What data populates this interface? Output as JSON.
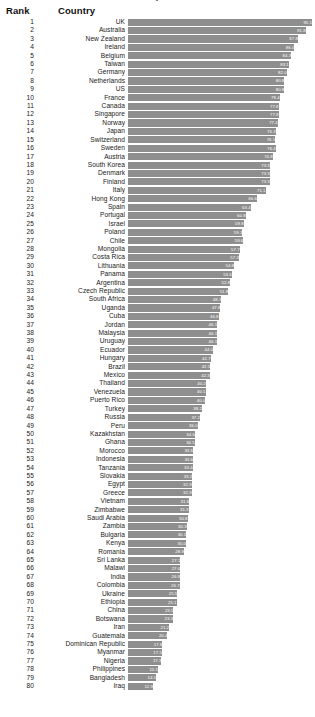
{
  "header": {
    "rank_label": "Rank",
    "country_label": "Country",
    "title_remnant": "y"
  },
  "chart_data": {
    "type": "bar",
    "title": "",
    "xlabel": "",
    "ylabel": "",
    "xlim": [
      0,
      95.1
    ],
    "grid": false,
    "legend": null,
    "orientation": "horizontal",
    "bar_color": "#8e8e8e",
    "value_label_color": "#ffffff",
    "columns": [
      "Rank",
      "Country",
      "Value"
    ],
    "categories": [
      "UK",
      "Australia",
      "New Zealand",
      "Ireland",
      "Belgium",
      "Taiwan",
      "Germany",
      "Netherlands",
      "US",
      "France",
      "Canada",
      "Singapore",
      "Norway",
      "Japan",
      "Switzerland",
      "Sweden",
      "Austria",
      "South Korea",
      "Denmark",
      "Finland",
      "Italy",
      "Hong Kong",
      "Spain",
      "Portugal",
      "Israel",
      "Poland",
      "Chile",
      "Mongolia",
      "Costa Rica",
      "Lithuania",
      "Panama",
      "Argentina",
      "Czech Republic",
      "South Africa",
      "Uganda",
      "Cuba",
      "Jordan",
      "Malaysia",
      "Uruguay",
      "Ecuador",
      "Hungary",
      "Brazil",
      "Mexico",
      "Thailand",
      "Venezuela",
      "Puerto Rico",
      "Turkey",
      "Russia",
      "Peru",
      "Kazakhstan",
      "Ghana",
      "Morocco",
      "Indonesia",
      "Tanzania",
      "Slovakia",
      "Egypt",
      "Greece",
      "Vietnam",
      "Zimbabwe",
      "Saudi Arabia",
      "Zambia",
      "Bulgaria",
      "Kenya",
      "Romania",
      "Sri Lanka",
      "Malawi",
      "India",
      "Colombia",
      "Ukraine",
      "Ethiopia",
      "China",
      "Botswana",
      "Iran",
      "Guatemala",
      "Dominican Republic",
      "Myanmar",
      "Nigeria",
      "Philippines",
      "Bangladesh",
      "Iraq"
    ],
    "values": [
      95.1,
      91.8,
      87.8,
      86.0,
      84.3,
      83.1,
      82.0,
      80.8,
      80.8,
      78.4,
      77.8,
      77.8,
      77.4,
      76.3,
      76.1,
      76.4,
      74.8,
      73.3,
      73.3,
      73.3,
      71.1,
      66.6,
      63.4,
      60.8,
      59.8,
      59.1,
      59.6,
      57.7,
      57.3,
      54.8,
      53.6,
      52.8,
      51.8,
      48.3,
      47.8,
      46.8,
      46.1,
      46.1,
      46.1,
      44.0,
      42.7,
      42.5,
      42.3,
      40.2,
      40.1,
      40.0,
      38.2,
      37.2,
      36.0,
      34.6,
      34.5,
      33.6,
      33.6,
      33.4,
      33.2,
      32.9,
      32.9,
      31.6,
      31.3,
      30.8,
      30.3,
      30.1,
      30.0,
      28.9,
      27.1,
      27.0,
      26.9,
      26.7,
      25.5,
      25.1,
      23.5,
      23.3,
      21.2,
      20.4,
      17.8,
      17.5,
      17.3,
      15.5,
      14.5,
      12.9
    ],
    "rows": [
      {
        "rank": "1",
        "country": "UK",
        "value": "95.1"
      },
      {
        "rank": "2",
        "country": "Australia",
        "value": "91.8"
      },
      {
        "rank": "3",
        "country": "New Zealand",
        "value": "87.8"
      },
      {
        "rank": "4",
        "country": "Ireland",
        "value": "86.0"
      },
      {
        "rank": "5",
        "country": "Belgium",
        "value": "84.3"
      },
      {
        "rank": "6",
        "country": "Taiwan",
        "value": "83.1"
      },
      {
        "rank": "7",
        "country": "Germany",
        "value": "82.0"
      },
      {
        "rank": "8",
        "country": "Netherlands",
        "value": "80.8"
      },
      {
        "rank": "9",
        "country": "US",
        "value": "80.8"
      },
      {
        "rank": "10",
        "country": "France",
        "value": "78.4"
      },
      {
        "rank": "11",
        "country": "Canada",
        "value": "77.8"
      },
      {
        "rank": "12",
        "country": "Singapore",
        "value": "77.8"
      },
      {
        "rank": "13",
        "country": "Norway",
        "value": "77.4"
      },
      {
        "rank": "14",
        "country": "Japan",
        "value": "76.3"
      },
      {
        "rank": "15",
        "country": "Switzerland",
        "value": "76.1"
      },
      {
        "rank": "16",
        "country": "Sweden",
        "value": "76.4"
      },
      {
        "rank": "17",
        "country": "Austria",
        "value": "74.8"
      },
      {
        "rank": "18",
        "country": "South Korea",
        "value": "73.3"
      },
      {
        "rank": "19",
        "country": "Denmark",
        "value": "73.3"
      },
      {
        "rank": "20",
        "country": "Finland",
        "value": "73.3"
      },
      {
        "rank": "21",
        "country": "Italy",
        "value": "71.1"
      },
      {
        "rank": "22",
        "country": "Hong Kong",
        "value": "66.6"
      },
      {
        "rank": "23",
        "country": "Spain",
        "value": "63.4"
      },
      {
        "rank": "24",
        "country": "Portugal",
        "value": "60.8"
      },
      {
        "rank": "25",
        "country": "Israel",
        "value": "59.8"
      },
      {
        "rank": "26",
        "country": "Poland",
        "value": "59.1"
      },
      {
        "rank": "27",
        "country": "Chile",
        "value": "59.6"
      },
      {
        "rank": "28",
        "country": "Mongolia",
        "value": "57.7"
      },
      {
        "rank": "29",
        "country": "Costa Rica",
        "value": "57.3"
      },
      {
        "rank": "30",
        "country": "Lithuania",
        "value": "54.8"
      },
      {
        "rank": "31",
        "country": "Panama",
        "value": "53.6"
      },
      {
        "rank": "32",
        "country": "Argentina",
        "value": "52.8"
      },
      {
        "rank": "33",
        "country": "Czech Republic",
        "value": "51.8"
      },
      {
        "rank": "34",
        "country": "South Africa",
        "value": "48.3"
      },
      {
        "rank": "35",
        "country": "Uganda",
        "value": "47.8"
      },
      {
        "rank": "36",
        "country": "Cuba",
        "value": "46.8"
      },
      {
        "rank": "37",
        "country": "Jordan",
        "value": "46.1"
      },
      {
        "rank": "38",
        "country": "Malaysia",
        "value": "46.1"
      },
      {
        "rank": "39",
        "country": "Uruguay",
        "value": "46.1"
      },
      {
        "rank": "40",
        "country": "Ecuador",
        "value": "44.0"
      },
      {
        "rank": "41",
        "country": "Hungary",
        "value": "42.7"
      },
      {
        "rank": "42",
        "country": "Brazil",
        "value": "42.5"
      },
      {
        "rank": "43",
        "country": "Mexico",
        "value": "42.3"
      },
      {
        "rank": "44",
        "country": "Thailand",
        "value": "40.2"
      },
      {
        "rank": "45",
        "country": "Venezuela",
        "value": "40.1"
      },
      {
        "rank": "46",
        "country": "Puerto Rico",
        "value": "40.0"
      },
      {
        "rank": "47",
        "country": "Turkey",
        "value": "38.2"
      },
      {
        "rank": "48",
        "country": "Russia",
        "value": "37.2"
      },
      {
        "rank": "49",
        "country": "Peru",
        "value": "36.0"
      },
      {
        "rank": "50",
        "country": "Kazakhstan",
        "value": "34.6"
      },
      {
        "rank": "51",
        "country": "Ghana",
        "value": "34.5"
      },
      {
        "rank": "52",
        "country": "Morocco",
        "value": "33.6"
      },
      {
        "rank": "53",
        "country": "Indonesia",
        "value": "33.6"
      },
      {
        "rank": "54",
        "country": "Tanzania",
        "value": "33.4"
      },
      {
        "rank": "55",
        "country": "Slovakia",
        "value": "33.2"
      },
      {
        "rank": "56",
        "country": "Egypt",
        "value": "32.9"
      },
      {
        "rank": "57",
        "country": "Greece",
        "value": "32.9"
      },
      {
        "rank": "58",
        "country": "Vietnam",
        "value": "31.6"
      },
      {
        "rank": "59",
        "country": "Zimbabwe",
        "value": "31.3"
      },
      {
        "rank": "60",
        "country": "Saudi Arabia",
        "value": "30.8"
      },
      {
        "rank": "61",
        "country": "Zambia",
        "value": "30.3"
      },
      {
        "rank": "62",
        "country": "Bulgaria",
        "value": "30.1"
      },
      {
        "rank": "63",
        "country": "Kenya",
        "value": "30.0"
      },
      {
        "rank": "64",
        "country": "Romania",
        "value": "28.9"
      },
      {
        "rank": "65",
        "country": "Sri Lanka",
        "value": "27.1"
      },
      {
        "rank": "66",
        "country": "Malawi",
        "value": "27.0"
      },
      {
        "rank": "67",
        "country": "India",
        "value": "26.9"
      },
      {
        "rank": "68",
        "country": "Colombia",
        "value": "26.7"
      },
      {
        "rank": "69",
        "country": "Ukraine",
        "value": "25.5"
      },
      {
        "rank": "70",
        "country": "Ethiopia",
        "value": "25.1"
      },
      {
        "rank": "71",
        "country": "China",
        "value": "23.5"
      },
      {
        "rank": "72",
        "country": "Botswana",
        "value": "23.3"
      },
      {
        "rank": "73",
        "country": "Iran",
        "value": "21.2"
      },
      {
        "rank": "74",
        "country": "Guatemala",
        "value": "20.4"
      },
      {
        "rank": "75",
        "country": "Dominican Republic",
        "value": "17.8"
      },
      {
        "rank": "76",
        "country": "Myanmar",
        "value": "17.5"
      },
      {
        "rank": "77",
        "country": "Nigeria",
        "value": "17.3"
      },
      {
        "rank": "78",
        "country": "Philippines",
        "value": "15.5"
      },
      {
        "rank": "79",
        "country": "Bangladesh",
        "value": "14.5"
      },
      {
        "rank": "80",
        "country": "Iraq",
        "value": "12.9"
      }
    ]
  }
}
